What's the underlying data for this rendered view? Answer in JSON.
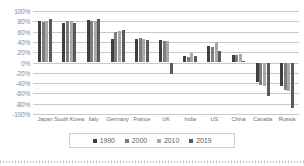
{
  "chart_data": {
    "type": "bar",
    "title": "",
    "subtitle": "",
    "xlabel": "",
    "ylabel": "",
    "grid": true,
    "legend_position": "bottom",
    "ylim": [
      -100,
      100
    ],
    "ytick_format": "percent",
    "yticks": [
      100,
      80,
      60,
      40,
      20,
      0,
      -20,
      -40,
      -60,
      -80,
      -100
    ],
    "ytick_labels": [
      "100%",
      "80%",
      "60%",
      "40%",
      "20%",
      "0%",
      "-20%",
      "-40%",
      "-60%",
      "-80%",
      "-100%"
    ],
    "categories": [
      "Japan",
      "South Korea",
      "Italy",
      "Germany",
      "France",
      "UK",
      "India",
      "US",
      "China",
      "Canada",
      "Russia"
    ],
    "series": [
      {
        "name": "1990",
        "color": "#3f3f3f",
        "values": [
          80,
          76,
          82,
          46,
          46,
          44,
          13,
          32,
          14,
          -38,
          -46
        ]
      },
      {
        "name": "2000",
        "color": "#7d7d7d",
        "values": [
          78,
          80,
          80,
          60,
          47,
          42,
          11,
          30,
          15,
          -44,
          -54
        ]
      },
      {
        "name": "2010",
        "color": "#a9a9a9",
        "values": [
          80,
          80,
          81,
          61,
          46,
          42,
          18,
          40,
          16,
          -46,
          -56
        ]
      },
      {
        "name": "2019",
        "color": "#5a5a5a",
        "values": [
          85,
          76,
          84,
          64,
          44,
          -22,
          13,
          22,
          3,
          -66,
          -88
        ]
      }
    ]
  },
  "legend": {
    "items": [
      {
        "label": "1990",
        "color": "#3f3f3f"
      },
      {
        "label": "2000",
        "color": "#7d7d7d"
      },
      {
        "label": "2010",
        "color": "#a9a9a9"
      },
      {
        "label": "2019",
        "color": "#5a5a5a"
      }
    ]
  }
}
